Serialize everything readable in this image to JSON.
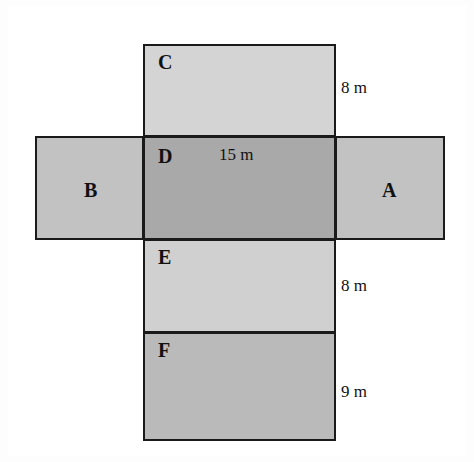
{
  "diagram": {
    "background_color": "#ffffff",
    "stroke_color": "#1a1a1a",
    "faces": [
      {
        "id": "A",
        "label": "A",
        "fill": "#c2c2c2",
        "position": "right",
        "width_m": 9,
        "height_m": 8
      },
      {
        "id": "B",
        "label": "B",
        "fill": "#c2c2c2",
        "position": "left",
        "width_m": 9,
        "height_m": 8
      },
      {
        "id": "C",
        "label": "C",
        "fill": "#d4d4d4",
        "position": "top",
        "width_m": 15,
        "height_m": 8
      },
      {
        "id": "D",
        "label": "D",
        "fill": "#a9a9a9",
        "position": "center",
        "width_m": 15,
        "height_m": 8
      },
      {
        "id": "E",
        "label": "E",
        "fill": "#d0d0d0",
        "position": "below-center",
        "width_m": 15,
        "height_m": 8
      },
      {
        "id": "F",
        "label": "F",
        "fill": "#bababa",
        "position": "bottom",
        "width_m": 15,
        "height_m": 9
      }
    ],
    "dimensions": [
      {
        "id": "top",
        "text": "8 m",
        "value": 8,
        "unit": "m",
        "applies_to": "C"
      },
      {
        "id": "middle",
        "text": "15 m",
        "value": 15,
        "unit": "m",
        "applies_to": "D"
      },
      {
        "id": "lower",
        "text": "8 m",
        "value": 8,
        "unit": "m",
        "applies_to": "E"
      },
      {
        "id": "bottom",
        "text": "9 m",
        "value": 9,
        "unit": "m",
        "applies_to": "F"
      }
    ]
  }
}
